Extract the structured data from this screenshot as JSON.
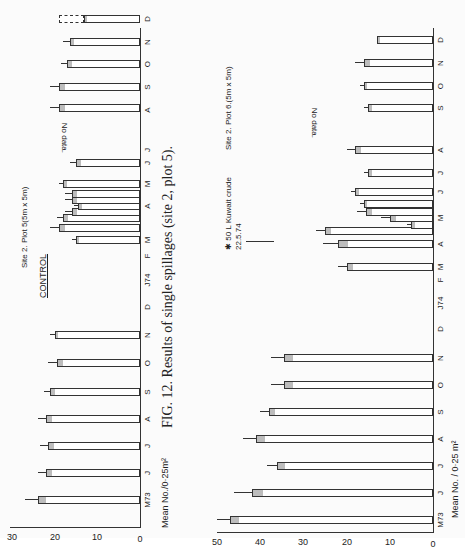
{
  "caption": "FIG. 12.  Results of single spillages (site 2, plot 5).",
  "chart_data": [
    {
      "type": "bar",
      "title": "CONTROL",
      "subtitle": "Site 2. Plot 5(5m x 5m)",
      "ylabel": "Mean No./0·25m²",
      "xlabel": "",
      "ylim": [
        0,
        30
      ],
      "yticks": [
        0,
        10,
        20,
        30
      ],
      "x_tick_labels": [
        "M73",
        "J",
        "J",
        "A",
        "S",
        "O",
        "N",
        "D",
        "J74",
        "F",
        "M",
        "A",
        "M",
        "J",
        "J",
        "A",
        "S",
        "O",
        "N",
        "D",
        "J75"
      ],
      "annotations": [
        "No data. (Sept 1974)"
      ],
      "grid": false,
      "bars": [
        {
          "month": "M73",
          "value": 24,
          "err": 3
        },
        {
          "month": "J",
          "value": 22,
          "err": 2
        },
        {
          "month": "J",
          "value": 21.5,
          "err": 2
        },
        {
          "month": "A",
          "value": 22,
          "err": 2
        },
        {
          "month": "S",
          "value": 21,
          "err": 1.5
        },
        {
          "month": "O",
          "value": 19.5,
          "err": 2
        },
        {
          "month": "N",
          "value": 20,
          "err": 1
        },
        {
          "month": "M",
          "value": 15,
          "err": 1
        },
        {
          "month": "A",
          "value": 19,
          "err": 2
        },
        {
          "month": "M",
          "value": 18,
          "err": 1.5
        },
        {
          "month": "M",
          "value": 16,
          "err": 1.5
        },
        {
          "month": "M",
          "value": 14.5,
          "err": 1
        },
        {
          "month": "M",
          "value": 16,
          "err": 1.5
        },
        {
          "month": "J",
          "value": 16,
          "err": 1.5
        },
        {
          "month": "J",
          "value": 18,
          "err": 1
        },
        {
          "month": "J",
          "value": 15,
          "err": 1.5
        },
        {
          "month": "A",
          "value": 19,
          "err": 2
        },
        {
          "month": "O",
          "value": 19,
          "err": 2
        },
        {
          "month": "N",
          "value": 17,
          "err": 1.5
        },
        {
          "month": "D",
          "value": 16.5,
          "err": 1.5
        },
        {
          "month": "J75",
          "value": 13,
          "err": 0,
          "dashed_to": 19
        }
      ]
    },
    {
      "type": "bar",
      "title": "",
      "subtitle": "Site 2. Plot 6.(5m x 5m)",
      "ylabel": "Mean No. / 0·25 m²",
      "xlabel": "",
      "ylim": [
        0,
        50
      ],
      "yticks": [
        0,
        10,
        20,
        30,
        40,
        50
      ],
      "x_tick_labels": [
        "M73",
        "J",
        "J",
        "A",
        "S",
        "O",
        "N",
        "D",
        "J74",
        "F",
        "M",
        "A",
        "M",
        "J",
        "J",
        "A",
        "S",
        "O",
        "N",
        "D",
        "J75"
      ],
      "annotations": [
        "✱ 50 L Kuwait crude 22.5.74",
        "No data. (Sept 1974)"
      ],
      "grid": false,
      "bars": [
        {
          "month": "M73",
          "value": 47,
          "err": 3
        },
        {
          "month": "J",
          "value": 42,
          "err": 4
        },
        {
          "month": "J",
          "value": 36,
          "err": 2.5
        },
        {
          "month": "A",
          "value": 41,
          "err": 3
        },
        {
          "month": "S",
          "value": 38,
          "err": 2
        },
        {
          "month": "O",
          "value": 34.5,
          "err": 3
        },
        {
          "month": "N",
          "value": 34.5,
          "err": 3
        },
        {
          "month": "M",
          "value": 20,
          "err": 2
        },
        {
          "month": "A",
          "value": 22,
          "err": 3.5
        },
        {
          "month": "M",
          "value": 25,
          "err": 2
        },
        {
          "month": "M",
          "value": 5,
          "err": 1
        },
        {
          "month": "M",
          "value": 10,
          "err": 2
        },
        {
          "month": "J",
          "value": 15.5,
          "err": 2
        },
        {
          "month": "J",
          "value": 16,
          "err": 1
        },
        {
          "month": "J",
          "value": 18,
          "err": 1
        },
        {
          "month": "J",
          "value": 15,
          "err": 1
        },
        {
          "month": "A",
          "value": 18,
          "err": 2
        },
        {
          "month": "O",
          "value": 15,
          "err": 1
        },
        {
          "month": "N",
          "value": 16,
          "err": 1
        },
        {
          "month": "D",
          "value": 16,
          "err": 2
        },
        {
          "month": "J75",
          "value": 13,
          "err": 0
        }
      ]
    }
  ]
}
